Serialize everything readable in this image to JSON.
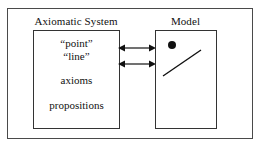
{
  "figure": {
    "background_color": "#ffffff",
    "frame_color": "#4a4a4a",
    "box_color": "#333333",
    "text_color": "#111111"
  },
  "axiomatic_system": {
    "label": "Axiomatic System",
    "terms": [
      {
        "text": "“point”"
      },
      {
        "text": "“line”"
      },
      {
        "text": "axioms"
      },
      {
        "text": "propositions"
      }
    ]
  },
  "model": {
    "label": "Model",
    "marks": [
      {
        "kind": "point-dot"
      },
      {
        "kind": "line-segment"
      }
    ]
  },
  "connections": [
    {
      "kind": "double-headed-arrow"
    },
    {
      "kind": "double-headed-arrow"
    }
  ]
}
